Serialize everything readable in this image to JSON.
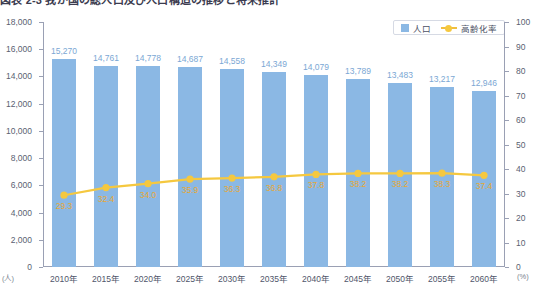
{
  "title": {
    "text": "図表 2-3 我が国の総人口及び人口構造の推移と将来推計",
    "clipped": true
  },
  "legend": {
    "items": [
      {
        "label": "人口",
        "type": "bar",
        "color": "#8bb8e4"
      },
      {
        "label": "高齢化率",
        "type": "line",
        "color": "#f5c83f"
      }
    ]
  },
  "axes": {
    "left_unit": "(人)",
    "right_unit": "(%)",
    "left_ticks": [
      "18,000",
      "16,000",
      "14,000",
      "12,000",
      "10,000",
      "8,000",
      "6,000",
      "4,000",
      "2,000",
      "0"
    ],
    "right_ticks": [
      "100",
      "90",
      "80",
      "70",
      "60",
      "50",
      "40",
      "30",
      "20",
      "10",
      "0"
    ]
  },
  "chart_data": {
    "type": "bar",
    "title": "図表 2-3 我が国の総人口及び人口構造の推移と将来推計",
    "xlabel": "",
    "ylabel": "人口",
    "categories": [
      "2010年",
      "2015年",
      "2020年",
      "2025年",
      "2030年",
      "2035年",
      "2040年",
      "2045年",
      "2050年",
      "2055年",
      "2060年"
    ],
    "series": [
      {
        "name": "人口",
        "type": "bar",
        "axis": "left",
        "unit": "(人)",
        "color": "#8bb8e4",
        "values": [
          15270,
          14761,
          14778,
          14687,
          14558,
          14349,
          14079,
          13789,
          13483,
          13217,
          12946
        ],
        "labels": [
          "15,270",
          "14,761",
          "14,778",
          "14,687",
          "14,558",
          "14,349",
          "14,079",
          "13,789",
          "13,483",
          "13,217",
          "12,946"
        ]
      },
      {
        "name": "高齢化率",
        "type": "line",
        "axis": "right",
        "unit": "(%)",
        "color": "#f5c83f",
        "values": [
          29.3,
          32.4,
          34.0,
          35.9,
          36.3,
          36.8,
          37.8,
          38.2,
          38.2,
          38.3,
          37.4
        ],
        "labels": [
          "29.3",
          "32.4",
          "34.0",
          "35.9",
          "36.3",
          "36.8",
          "37.8",
          "38.2",
          "38.2",
          "38.3",
          "37.4"
        ]
      }
    ],
    "ylim": [
      0,
      18000
    ],
    "y2lim": [
      0,
      100
    ],
    "ytick_step": 2000,
    "y2tick_step": 10,
    "grid": false,
    "legend_position": "top-right"
  }
}
